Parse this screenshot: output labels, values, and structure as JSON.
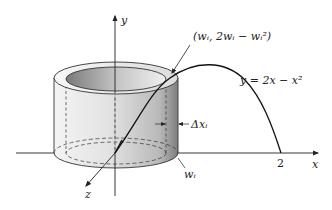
{
  "diagram": {
    "type": "solid-of-revolution-cylindrical-shell",
    "axes": {
      "x_label": "x",
      "y_label": "y",
      "z_label": "z"
    },
    "curve": {
      "equation_label": "y = 2x − x²",
      "x_intercept_label": "2"
    },
    "annotations": {
      "point_label": "(wᵢ, 2wᵢ − wᵢ²)",
      "thickness_label": "Δxᵢ",
      "radius_label": "wᵢ"
    },
    "colors": {
      "ink": "#222222",
      "shell_light": "#e6e6e6",
      "shell_dark": "#8a8a8a",
      "background": "#ffffff"
    }
  }
}
